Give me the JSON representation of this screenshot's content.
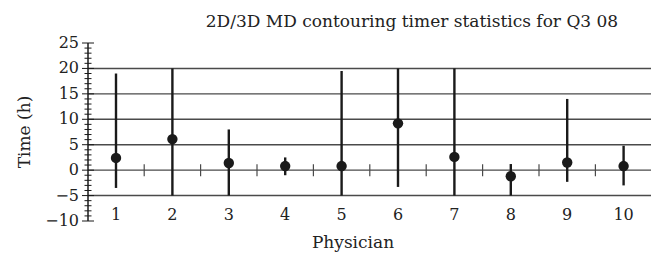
{
  "chart_data": {
    "type": "scatter",
    "subtype": "error-bar",
    "title": "2D/3D MD contouring timer statistics for Q3 08",
    "xlabel": "Physician",
    "ylabel": "Time (h)",
    "categories": [
      "1",
      "2",
      "3",
      "4",
      "5",
      "6",
      "7",
      "8",
      "9",
      "10"
    ],
    "series": [
      {
        "name": "Mean time",
        "values": [
          2.4,
          6.1,
          1.4,
          0.8,
          0.8,
          9.2,
          2.6,
          -1.2,
          1.5,
          0.8
        ],
        "upper": [
          19,
          20,
          8,
          2.5,
          19.5,
          20,
          20,
          1.2,
          14,
          4.8
        ],
        "lower": [
          -3.5,
          -5,
          -5,
          -1,
          -5,
          -3.3,
          -5,
          -5,
          -2.3,
          -3
        ]
      }
    ],
    "ylim": [
      -10,
      25
    ],
    "yticks": [
      -10,
      -5,
      0,
      5,
      10,
      15,
      20,
      25
    ],
    "ytick_labels": [
      "−10",
      "−5",
      "0",
      "5",
      "10",
      "15",
      "20",
      "25"
    ],
    "grid_lines_y": [
      -5,
      0,
      5,
      10,
      15,
      20
    ],
    "grid": true,
    "legend": "none"
  },
  "colors": {
    "ink": "#1a1a1a",
    "grid": "#4a4a4a"
  }
}
